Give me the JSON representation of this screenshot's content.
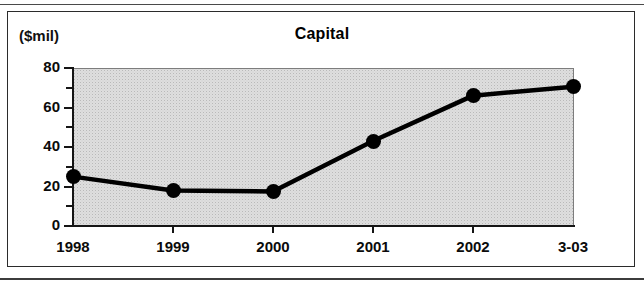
{
  "figure": {
    "unit_label": "($mil)",
    "title": "Capital"
  },
  "chart_data": {
    "type": "line",
    "title": "Capital",
    "xlabel": "",
    "ylabel": "($mil)",
    "categories": [
      "1998",
      "1999",
      "2000",
      "2001",
      "2002",
      "3-03"
    ],
    "values": [
      25,
      18,
      17.5,
      43,
      66,
      70.5
    ],
    "ylim": [
      0,
      80
    ],
    "yticks_major": [
      0,
      20,
      40,
      60,
      80
    ],
    "yticks_minor": [
      10,
      30,
      50,
      70
    ],
    "grid": false,
    "legend": null,
    "marker": "filled-circle",
    "line_color": "#000000",
    "plot_background": "#dedede"
  },
  "axis": {
    "y_labels": [
      "80",
      "60",
      "40",
      "20",
      "0"
    ],
    "x_labels": [
      "1998",
      "1999",
      "2000",
      "2001",
      "2002",
      "3-03"
    ]
  }
}
